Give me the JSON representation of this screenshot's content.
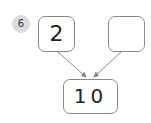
{
  "problem": {
    "number": "6",
    "left_value": "2",
    "right_value": "",
    "total_value": "10"
  },
  "colors": {
    "badge_bg": "#dcdcdc",
    "box_border": "#8a8a8a",
    "arrow": "#8a8a8a"
  }
}
